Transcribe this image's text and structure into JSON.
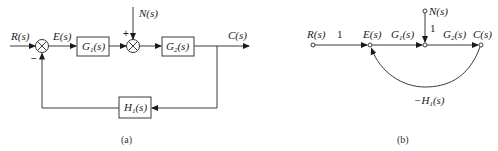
{
  "colors": {
    "stroke": "#3a3a3a",
    "text": "#1a1a1a",
    "background": "#ffffff"
  },
  "block_diagram": {
    "caption": "(a)",
    "input_label": "R(s)",
    "error_label": "E(s)",
    "disturbance_label": "N(s)",
    "output_label": "C(s)",
    "sum1_feedback_sign": "−",
    "sum2_disturbance_sign": "+",
    "blocks": {
      "g1": {
        "base": "G",
        "sub": "1",
        "arg": "(s)"
      },
      "g2": {
        "base": "G",
        "sub": "2",
        "arg": "(s)"
      },
      "h1": {
        "base": "H",
        "sub": "1",
        "arg": "(s)"
      }
    }
  },
  "signal_flow_graph": {
    "caption": "(b)",
    "nodes": {
      "r": "R(s)",
      "e": "E(s)",
      "c": "C(s)",
      "n": "N(s)"
    },
    "branches": {
      "r_to_e": "1",
      "e_to_mid": {
        "base": "G",
        "sub": "1",
        "arg": "(s)"
      },
      "n_to_mid": "1",
      "mid_to_c": {
        "base": "G",
        "sub": "2",
        "arg": "(s)"
      },
      "c_to_e": {
        "prefix": "−",
        "base": "H",
        "sub": "1",
        "arg": "(s)"
      }
    }
  }
}
